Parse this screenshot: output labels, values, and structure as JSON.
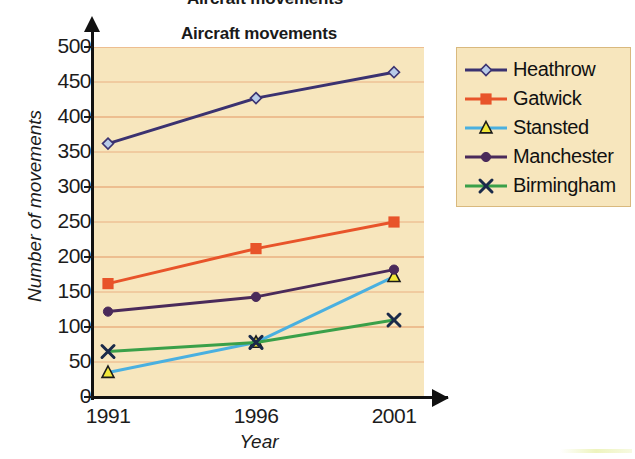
{
  "title_clipped": "Aircraft movements",
  "chart_title": "Aircraft movements",
  "axis": {
    "ylabel": "Number of movements",
    "xlabel": "Year"
  },
  "legend": {
    "items": [
      {
        "label": "Heathrow",
        "color": "#3b3270",
        "marker": "diamond",
        "marker_fill": "#b8cbe8"
      },
      {
        "label": "Gatwick",
        "color": "#e8542a",
        "marker": "square",
        "marker_fill": "#e8542a"
      },
      {
        "label": "Stansted",
        "color": "#4ab0e0",
        "marker": "triangle",
        "marker_fill": "#f2e83a"
      },
      {
        "label": "Manchester",
        "color": "#4a2a5a",
        "marker": "circle",
        "marker_fill": "#4a2a5a"
      },
      {
        "label": "Birmingham",
        "color": "#3aa049",
        "marker": "cross",
        "marker_fill": "#1a2a4a"
      }
    ]
  },
  "colors": {
    "plot_background": "#f7e6bd",
    "gridline": "#e8a878",
    "axis": "#111111",
    "legend_border": "#d9b97e"
  },
  "chart_data": {
    "type": "line",
    "title": "Aircraft movements",
    "xlabel": "Year",
    "ylabel": "Number of movements",
    "categories": [
      "1991",
      "1996",
      "2001"
    ],
    "x": [
      1991,
      1996,
      2001
    ],
    "ylim": [
      0,
      500
    ],
    "yticks": [
      0,
      50,
      100,
      150,
      200,
      250,
      300,
      350,
      400,
      450,
      500
    ],
    "grid": true,
    "legend_position": "right",
    "series": [
      {
        "name": "Heathrow",
        "values": [
          362,
          427,
          464
        ]
      },
      {
        "name": "Gatwick",
        "values": [
          162,
          212,
          250
        ]
      },
      {
        "name": "Stansted",
        "values": [
          35,
          78,
          172
        ]
      },
      {
        "name": "Manchester",
        "values": [
          122,
          143,
          182
        ]
      },
      {
        "name": "Birmingham",
        "values": [
          65,
          78,
          110
        ]
      }
    ]
  }
}
